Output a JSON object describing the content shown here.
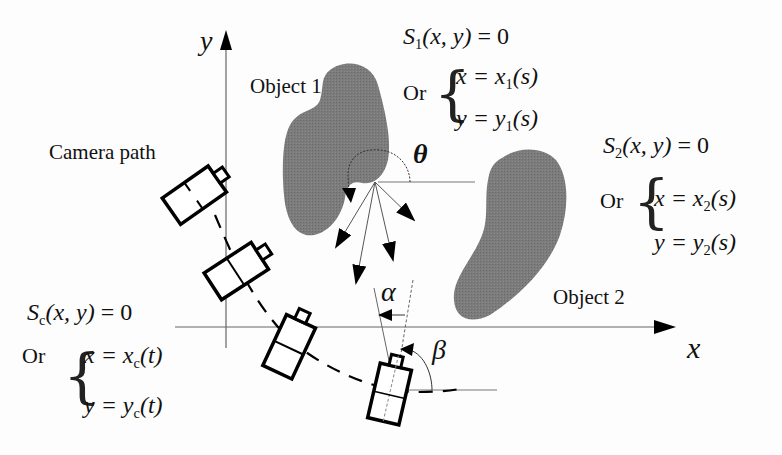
{
  "axes": {
    "x_label": "x",
    "y_label": "y"
  },
  "objects": [
    {
      "name": "Object 1",
      "fill": "#7a7a7a",
      "implicit": {
        "S": "S",
        "sub": "1",
        "args": "(x, y)",
        "eq": "= 0"
      },
      "or_label": "Or",
      "param_x": {
        "lhs": "x",
        "rhs": "x",
        "sub": "1",
        "arg": "(s)"
      },
      "param_y": {
        "lhs": "y",
        "rhs": "y",
        "sub": "1",
        "arg": "(s)"
      }
    },
    {
      "name": "Object 2",
      "fill": "#7a7a7a",
      "implicit": {
        "S": "S",
        "sub": "2",
        "args": "(x, y)",
        "eq": "= 0"
      },
      "or_label": "Or",
      "param_x": {
        "lhs": "x",
        "rhs": "x",
        "sub": "2",
        "arg": "(s)"
      },
      "param_y": {
        "lhs": "y",
        "rhs": "y",
        "sub": "2",
        "arg": "(s)"
      }
    }
  ],
  "camera": {
    "path_label": "Camera path",
    "implicit": {
      "S": "S",
      "sub": "c",
      "args": "(x, y)",
      "eq": "= 0"
    },
    "or_label": "Or",
    "param_x": {
      "lhs": "x",
      "rhs": "x",
      "sub": "c",
      "arg": "(t)"
    },
    "param_y": {
      "lhs": "y",
      "rhs": "y",
      "sub": "c",
      "arg": "(t)"
    },
    "count": 4
  },
  "angles": {
    "theta": "θ",
    "alpha": "α",
    "beta": "β"
  },
  "colors": {
    "object_fill": "#7a7a7a",
    "line": "#000000",
    "axis": "#555555"
  }
}
